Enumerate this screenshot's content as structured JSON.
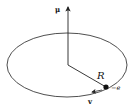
{
  "diagram": {
    "title": "",
    "labels": {
      "magnetic_moment": "μ",
      "radius": "R",
      "charge": "−e",
      "velocity": "v"
    },
    "elements": {
      "orbit": {
        "shape": "ellipse",
        "cx": 67,
        "cy": 65,
        "rx": 60,
        "ry": 32
      },
      "moment_vector": {
        "from": [
          68,
          65
        ],
        "to": [
          68,
          6
        ],
        "direction": "up"
      },
      "radius_line": {
        "from": [
          68,
          65
        ],
        "to": [
          106,
          87
        ]
      },
      "electron": {
        "x": 106,
        "y": 87,
        "r": 2.5
      },
      "velocity_arrow": {
        "at": [
          95,
          91
        ],
        "direction": "left"
      }
    },
    "colors": {
      "stroke": "#222222",
      "background": "#ffffff"
    }
  }
}
